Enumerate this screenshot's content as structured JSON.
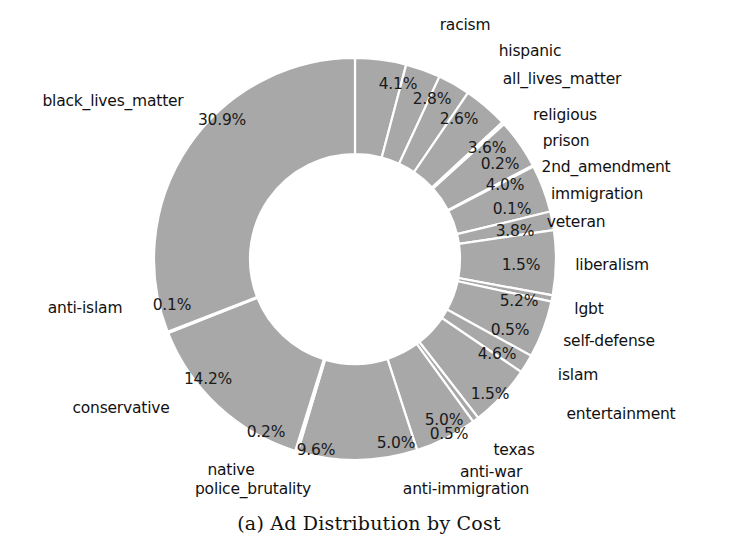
{
  "caption": "(a) Ad Distribution by Cost",
  "chart_data": {
    "type": "pie",
    "variant": "donut",
    "title": "(a) Ad Distribution by Cost",
    "xlabel": "",
    "ylabel": "",
    "units": "percent",
    "legend_position": "none",
    "grid": false,
    "autopct_format": "%.1f%%",
    "start_angle_deg": 90,
    "direction": "clockwise",
    "wedge_color": "#a8a8a8",
    "wedge_edge_color": "#ffffff",
    "inner_radius_ratio": 0.52,
    "labels": [
      "racism",
      "hispanic",
      "all_lives_matter",
      "religious",
      "prison",
      "2nd_amendment",
      "immigration",
      "veteran",
      "liberalism",
      "lgbt",
      "self-defense",
      "islam",
      "entertainment",
      "texas",
      "anti-war",
      "anti-immigration",
      "police_brutality",
      "native",
      "conservative",
      "anti-islam",
      "black_lives_matter"
    ],
    "values": [
      4.1,
      2.8,
      2.6,
      3.6,
      0.2,
      4.0,
      0.1,
      3.8,
      1.5,
      5.2,
      0.5,
      4.6,
      1.5,
      5.0,
      0.5,
      5.0,
      9.6,
      0.2,
      14.2,
      0.1,
      30.9
    ],
    "value_labels": [
      "4.1%",
      "2.8%",
      "2.6%",
      "3.6%",
      "0.2%",
      "4.0%",
      "0.1%",
      "3.8%",
      "1.5%",
      "5.2%",
      "0.5%",
      "4.6%",
      "1.5%",
      "5.0%",
      "0.5%",
      "5.0%",
      "9.6%",
      "0.2%",
      "14.2%",
      "0.1%",
      "30.9%"
    ],
    "slices": [
      {
        "label": "racism",
        "value": 4.1,
        "value_label": "4.1%",
        "pct_x": 398,
        "pct_y": 84,
        "cat_x": 465,
        "cat_y": 25
      },
      {
        "label": "hispanic",
        "value": 2.8,
        "value_label": "2.8%",
        "pct_x": 432,
        "pct_y": 99,
        "cat_x": 530,
        "cat_y": 51
      },
      {
        "label": "all_lives_matter",
        "value": 2.6,
        "value_label": "2.6%",
        "pct_x": 459,
        "pct_y": 119,
        "cat_x": 562,
        "cat_y": 79
      },
      {
        "label": "religious",
        "value": 3.6,
        "value_label": "3.6%",
        "pct_x": 487,
        "pct_y": 148,
        "cat_x": 565,
        "cat_y": 115
      },
      {
        "label": "prison",
        "value": 0.2,
        "value_label": "0.2%",
        "pct_x": 500,
        "pct_y": 164,
        "cat_x": 566,
        "cat_y": 141
      },
      {
        "label": "2nd_amendment",
        "value": 4.0,
        "value_label": "4.0%",
        "pct_x": 505,
        "pct_y": 185,
        "cat_x": 606,
        "cat_y": 167
      },
      {
        "label": "immigration",
        "value": 0.1,
        "value_label": "0.1%",
        "pct_x": 512,
        "pct_y": 209,
        "cat_x": 597,
        "cat_y": 194
      },
      {
        "label": "veteran",
        "value": 3.8,
        "value_label": "3.8%",
        "pct_x": 515,
        "pct_y": 231,
        "cat_x": 576,
        "cat_y": 222
      },
      {
        "label": "liberalism",
        "value": 1.5,
        "value_label": "1.5%",
        "pct_x": 521,
        "pct_y": 265,
        "cat_x": 612,
        "cat_y": 265
      },
      {
        "label": "lgbt",
        "value": 5.2,
        "value_label": "5.2%",
        "pct_x": 519,
        "pct_y": 301,
        "cat_x": 589,
        "cat_y": 309
      },
      {
        "label": "self-defense",
        "value": 0.5,
        "value_label": "0.5%",
        "pct_x": 510,
        "pct_y": 330,
        "cat_x": 609,
        "cat_y": 341
      },
      {
        "label": "islam",
        "value": 4.6,
        "value_label": "4.6%",
        "pct_x": 497,
        "pct_y": 354,
        "cat_x": 578,
        "cat_y": 375
      },
      {
        "label": "entertainment",
        "value": 1.5,
        "value_label": "1.5%",
        "pct_x": 490,
        "pct_y": 394,
        "cat_x": 621,
        "cat_y": 414
      },
      {
        "label": "texas",
        "value": 5.0,
        "value_label": "5.0%",
        "pct_x": 444,
        "pct_y": 420,
        "cat_x": 514,
        "cat_y": 450
      },
      {
        "label": "anti-war",
        "value": 0.5,
        "value_label": "0.5%",
        "pct_x": 449,
        "pct_y": 434,
        "cat_x": 491,
        "cat_y": 472
      },
      {
        "label": "anti-immigration",
        "value": 5.0,
        "value_label": "5.0%",
        "pct_x": 396,
        "pct_y": 443,
        "cat_x": 466,
        "cat_y": 489
      },
      {
        "label": "police_brutality",
        "value": 9.6,
        "value_label": "9.6%",
        "pct_x": 316,
        "pct_y": 450,
        "cat_x": 253,
        "cat_y": 489
      },
      {
        "label": "native",
        "value": 0.2,
        "value_label": "0.2%",
        "pct_x": 266,
        "pct_y": 432,
        "cat_x": 231,
        "cat_y": 470
      },
      {
        "label": "conservative",
        "value": 14.2,
        "value_label": "14.2%",
        "pct_x": 208,
        "pct_y": 379,
        "cat_x": 121,
        "cat_y": 408
      },
      {
        "label": "anti-islam",
        "value": 0.1,
        "value_label": "0.1%",
        "pct_x": 172,
        "pct_y": 305,
        "cat_x": 85,
        "cat_y": 308
      },
      {
        "label": "black_lives_matter",
        "value": 30.9,
        "value_label": "30.9%",
        "pct_x": 222,
        "pct_y": 120,
        "cat_x": 113,
        "cat_y": 101
      }
    ],
    "geometry": {
      "center_x": 355,
      "center_y": 259,
      "outer_radius": 201,
      "inner_radius": 105
    }
  }
}
